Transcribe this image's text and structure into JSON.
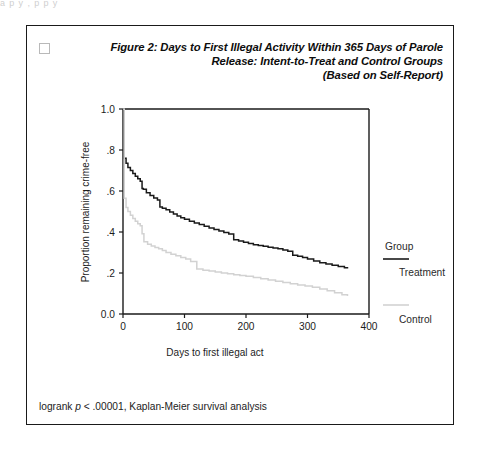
{
  "top_bleed": "a  p       y ,  p      p        y",
  "figure": {
    "checkbox_name": "figure-checkbox",
    "title_line1": "Figure 2: Days to First Illegal Activity Within 365 Days of Parole",
    "title_line2": "Release: Intent-to-Treat and Control Groups",
    "title_line3": "(Based on Self-Report)",
    "footnote_prefix": "logrank ",
    "footnote_italic": "p",
    "footnote_suffix": " < .00001, Kaplan-Meier survival analysis"
  },
  "chart_data": {
    "type": "line",
    "title": "Figure 2: Days to First Illegal Activity Within 365 Days of Parole Release: Intent-to-Treat and Control Groups (Based on Self-Report)",
    "subtitle": "Kaplan-Meier survival analysis",
    "xlabel": "Days to first illegal act",
    "ylabel": "Proportion remaining crime-free",
    "xlim": [
      0,
      400
    ],
    "ylim": [
      0.0,
      1.0
    ],
    "xticks": [
      0,
      100,
      200,
      300,
      400
    ],
    "xtick_labels": [
      "0",
      "100",
      "200",
      "300",
      "400"
    ],
    "yticks": [
      0.0,
      0.2,
      0.4,
      0.6,
      0.8,
      1.0
    ],
    "ytick_labels": [
      "0.0",
      ".2",
      ".4",
      ".6",
      ".8",
      "1.0"
    ],
    "grid": false,
    "legend_position": "right",
    "legend_title": "Group",
    "step_style": "post",
    "series": [
      {
        "name": "Treatment",
        "color": "#1a1a1a",
        "width": 1.5,
        "x": [
          0,
          2,
          5,
          8,
          12,
          16,
          20,
          24,
          28,
          31,
          33,
          38,
          44,
          50,
          56,
          60,
          64,
          70,
          76,
          82,
          88,
          94,
          100,
          108,
          116,
          124,
          132,
          140,
          148,
          156,
          164,
          172,
          180,
          188,
          196,
          204,
          212,
          220,
          228,
          236,
          244,
          252,
          260,
          268,
          276,
          284,
          292,
          300,
          310,
          320,
          330,
          340,
          350,
          360,
          365
        ],
        "y": [
          1.0,
          0.76,
          0.735,
          0.715,
          0.7,
          0.685,
          0.672,
          0.66,
          0.648,
          0.612,
          0.608,
          0.592,
          0.578,
          0.566,
          0.556,
          0.522,
          0.516,
          0.508,
          0.498,
          0.488,
          0.478,
          0.47,
          0.462,
          0.452,
          0.444,
          0.436,
          0.428,
          0.42,
          0.412,
          0.405,
          0.398,
          0.39,
          0.362,
          0.356,
          0.35,
          0.344,
          0.338,
          0.334,
          0.33,
          0.326,
          0.322,
          0.318,
          0.312,
          0.306,
          0.286,
          0.282,
          0.276,
          0.268,
          0.258,
          0.25,
          0.244,
          0.238,
          0.232,
          0.226,
          0.222
        ]
      },
      {
        "name": "Control",
        "color": "#d2d2d2",
        "width": 1.5,
        "x": [
          0,
          2,
          5,
          8,
          12,
          16,
          20,
          24,
          28,
          31,
          34,
          40,
          46,
          52,
          58,
          64,
          70,
          78,
          86,
          94,
          102,
          110,
          120,
          130,
          140,
          150,
          160,
          170,
          180,
          190,
          200,
          212,
          224,
          236,
          248,
          260,
          272,
          284,
          296,
          308,
          320,
          332,
          344,
          356,
          365
        ],
        "y": [
          1.0,
          0.565,
          0.52,
          0.5,
          0.482,
          0.466,
          0.452,
          0.44,
          0.43,
          0.392,
          0.352,
          0.34,
          0.332,
          0.325,
          0.318,
          0.31,
          0.3,
          0.292,
          0.284,
          0.276,
          0.268,
          0.256,
          0.22,
          0.214,
          0.21,
          0.205,
          0.2,
          0.196,
          0.192,
          0.188,
          0.184,
          0.178,
          0.172,
          0.166,
          0.16,
          0.154,
          0.148,
          0.142,
          0.136,
          0.13,
          0.122,
          0.114,
          0.104,
          0.094,
          0.088
        ]
      }
    ]
  }
}
